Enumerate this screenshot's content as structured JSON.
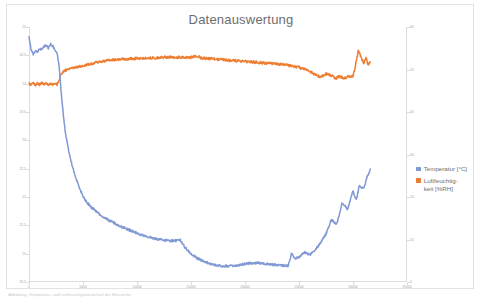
{
  "figure": {
    "title": "Datenauswertung",
    "caption": "Abbildung: Temperatur- und Luftfeuchtigkeitsverlauf der Messreihe"
  },
  "legend": {
    "position": "right",
    "items": [
      {
        "label": "Temperatur [°C]",
        "color": "#8098d4",
        "icon": "square-marker"
      },
      {
        "label": "Luftfeuchtig-\nkeit [%RH]",
        "label_line1": "Luftfeuchtig-",
        "label_line2": "keit [%RH]",
        "color": "#ed7d31",
        "icon": "square-marker"
      }
    ]
  },
  "axes": {
    "x": {
      "label": "",
      "min": 0,
      "max": 35000,
      "ticks": [
        0,
        5000,
        10000,
        15000,
        20000,
        25000,
        30000,
        35000
      ],
      "tick_labels": [
        "0",
        "5000",
        "10000",
        "15000",
        "20000",
        "25000",
        "30000",
        "35000"
      ]
    },
    "y_left": {
      "label": "Temperatur [°C]",
      "min": 20.5,
      "max": 25,
      "ticks": [
        20.5,
        21,
        21.5,
        22,
        22.5,
        23,
        23.5,
        24,
        24.5,
        25
      ],
      "tick_labels": [
        "20.5",
        "21",
        "21.5",
        "22",
        "22.5",
        "23",
        "23.5",
        "24",
        "24.5",
        "25"
      ]
    },
    "y_right": {
      "label": "Luftfeuchtigkeit [%RH]",
      "min": 0,
      "max": 60,
      "ticks": [
        0,
        10,
        20,
        30,
        40,
        50,
        60
      ],
      "tick_labels": [
        "0",
        "10",
        "20",
        "30",
        "40",
        "50",
        "60"
      ]
    }
  },
  "chart_data": {
    "type": "line",
    "title": "Datenauswertung",
    "xlabel": "",
    "ylabel": "Temperatur [°C]",
    "ylabel_secondary": "Luftfeuchtigkeit [%RH]",
    "xlim": [
      0,
      35000
    ],
    "ylim": [
      20.5,
      25
    ],
    "ylim_secondary": [
      0,
      60
    ],
    "grid": false,
    "legend_position": "right",
    "series": [
      {
        "name": "Temperatur [°C]",
        "color": "#8098d4",
        "axis": "left",
        "unit": "°C",
        "x": [
          0,
          200,
          400,
          600,
          800,
          1000,
          1200,
          1400,
          1600,
          1800,
          2000,
          2200,
          2400,
          2600,
          2800,
          3000,
          3200,
          3400,
          3600,
          3800,
          4000,
          4400,
          4800,
          5200,
          5600,
          6000,
          6500,
          7000,
          7500,
          8000,
          8500,
          9000,
          9500,
          10000,
          10500,
          11000,
          11500,
          12000,
          12500,
          13000,
          13500,
          14000,
          14500,
          15000,
          15500,
          16000,
          16500,
          17000,
          17500,
          18000,
          18500,
          19000,
          19500,
          20000,
          20500,
          21000,
          21500,
          22000,
          22500,
          23000,
          23500,
          24000,
          24300,
          24600,
          25000,
          25500,
          26000,
          26500,
          27000,
          27500,
          28000,
          28500,
          29000,
          29500,
          30000,
          30300,
          30600,
          31000,
          31300,
          31600
        ],
        "y": [
          24.82,
          24.6,
          24.52,
          24.58,
          24.55,
          24.62,
          24.6,
          24.66,
          24.68,
          24.63,
          24.7,
          24.66,
          24.6,
          24.55,
          24.3,
          23.8,
          23.4,
          23.1,
          22.9,
          22.7,
          22.55,
          22.3,
          22.1,
          21.95,
          21.85,
          21.78,
          21.7,
          21.63,
          21.58,
          21.53,
          21.48,
          21.44,
          21.4,
          21.36,
          21.33,
          21.3,
          21.27,
          21.25,
          21.24,
          21.23,
          21.23,
          21.24,
          21.1,
          21.0,
          20.93,
          20.88,
          20.84,
          20.81,
          20.79,
          20.78,
          20.78,
          20.79,
          20.8,
          20.82,
          20.83,
          20.84,
          20.83,
          20.82,
          20.81,
          20.8,
          20.79,
          20.79,
          21.0,
          20.92,
          20.94,
          21.02,
          20.98,
          21.06,
          21.2,
          21.35,
          21.6,
          21.52,
          21.9,
          21.78,
          22.1,
          21.95,
          22.2,
          22.15,
          22.35,
          22.48
        ],
        "noise": 0.02,
        "description": "Starts ~24.8 °C with small fluctuations, drops sharply after ~2800 s, decays to a minimum of ~20.78 °C near 18000–19500 s, then rises again with oscillations to ~22.5 °C at the end."
      },
      {
        "name": "Luftfeuchtigkeit [%RH]",
        "color": "#ed7d31",
        "axis": "right",
        "unit": "%RH",
        "x": [
          0,
          200,
          400,
          600,
          800,
          1000,
          1200,
          1400,
          1600,
          1800,
          2000,
          2200,
          2400,
          2600,
          2800,
          3000,
          3200,
          3600,
          4000,
          4500,
          5000,
          5500,
          6000,
          6500,
          7000,
          7500,
          8000,
          9000,
          10000,
          11000,
          12000,
          13000,
          14000,
          15000,
          15400,
          16000,
          17000,
          18000,
          19000,
          20000,
          21000,
          22000,
          23000,
          24000,
          25000,
          26000,
          26500,
          27000,
          27500,
          28000,
          28400,
          28800,
          29200,
          29600,
          30000,
          30200,
          30500,
          30800,
          31000,
          31200,
          31400,
          31600
        ],
        "y": [
          46.8,
          46.2,
          46.9,
          46.3,
          46.8,
          46.4,
          46.9,
          46.5,
          46.7,
          46.4,
          46.6,
          46.5,
          46.6,
          46.5,
          47.4,
          49.1,
          49.6,
          50.0,
          50.3,
          50.6,
          50.9,
          51.2,
          51.5,
          51.8,
          52.0,
          52.2,
          52.3,
          52.5,
          52.6,
          52.7,
          52.8,
          52.9,
          52.85,
          52.8,
          53.2,
          52.7,
          52.5,
          52.3,
          52.1,
          51.9,
          51.7,
          51.5,
          51.3,
          51.0,
          50.5,
          49.6,
          48.8,
          48.2,
          49.0,
          48.6,
          47.9,
          48.4,
          48.0,
          48.3,
          48.5,
          50.5,
          54.5,
          52.6,
          51.5,
          52.8,
          51.2,
          51.8
        ],
        "noise": 0.3,
        "description": "Starts noisy around 46.5 %RH, jumps up near 2800 s, rises gradually to a plateau of ~52.8 %RH around 12000–15000 s, slowly declines to ~48 %RH, then spikes sharply to ~54.5 %RH at the end."
      }
    ]
  }
}
